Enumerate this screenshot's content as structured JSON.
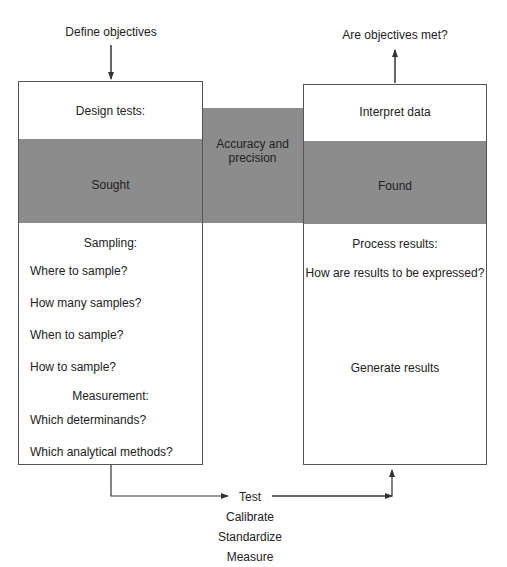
{
  "top": {
    "left_label": "Define objectives",
    "right_label": "Are objectives met?"
  },
  "left_box": {
    "header": "Design tests:",
    "band": "Sought",
    "sampling_title": "Sampling:",
    "sampling_items": [
      "Where to sample?",
      "How many samples?",
      "When to sample?",
      "How to sample?"
    ],
    "measurement_title": "Measurement:",
    "measurement_items": [
      "Which determinands?",
      "Which analytical methods?"
    ]
  },
  "middle": {
    "label_line1": "Accuracy and",
    "label_line2": "precision"
  },
  "right_box": {
    "header": "Interpret data",
    "band": "Found",
    "process_title": "Process results:",
    "process_item": "How are results to be expressed?",
    "generate": "Generate results"
  },
  "bottom": {
    "steps": [
      "Test",
      "Calibrate",
      "Standardize",
      "Measure"
    ]
  },
  "colors": {
    "band": "#8c8c8c",
    "line": "#333333"
  }
}
